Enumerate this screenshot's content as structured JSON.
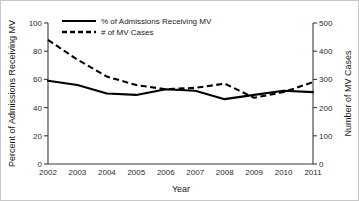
{
  "chart_data": {
    "type": "line",
    "title": "",
    "xlabel": "Year",
    "ylabel": "Percent of Admissions Receiving MV",
    "y2label": "Number of MV Cases",
    "categories": [
      2002,
      2003,
      2004,
      2005,
      2006,
      2007,
      2008,
      2009,
      2010,
      2011
    ],
    "xlim": [
      2002,
      2011
    ],
    "ylim": [
      0,
      100
    ],
    "y2lim": [
      0,
      500
    ],
    "yticks": [
      0,
      20,
      40,
      60,
      80,
      100
    ],
    "y2ticks": [
      0,
      100,
      200,
      300,
      400,
      500
    ],
    "xticks": [
      "2002",
      "2003",
      "2004",
      "2005",
      "2006",
      "2007",
      "2008",
      "2009",
      "2010",
      "2011"
    ],
    "grid": false,
    "legend_position": "top-left-inside",
    "series": [
      {
        "name": "% of Admissions Receiving MV",
        "axis": "left",
        "style": "solid",
        "color": "#000000",
        "values": [
          59,
          56,
          50,
          49,
          53,
          52,
          46,
          49,
          52,
          51
        ]
      },
      {
        "name": "# of MV Cases",
        "axis": "right",
        "style": "dashed",
        "color": "#000000",
        "values": [
          440,
          370,
          310,
          280,
          265,
          270,
          285,
          235,
          255,
          290
        ]
      }
    ]
  },
  "legend": {
    "entries": [
      {
        "label": "% of Admissions Receiving MV",
        "style": "solid"
      },
      {
        "label": "# of MV Cases",
        "style": "dashed"
      }
    ]
  },
  "axes": {
    "left_title": "Percent of Admissions Receiving MV",
    "right_title": "Number of MV Cases",
    "bottom_title": "Year",
    "left_ticks": [
      "0",
      "20",
      "40",
      "60",
      "80",
      "100"
    ],
    "right_ticks": [
      "0",
      "100",
      "200",
      "300",
      "400",
      "500"
    ],
    "bottom_ticks": [
      "2002",
      "2003",
      "2004",
      "2005",
      "2006",
      "2007",
      "2008",
      "2009",
      "2010",
      "2011"
    ]
  }
}
